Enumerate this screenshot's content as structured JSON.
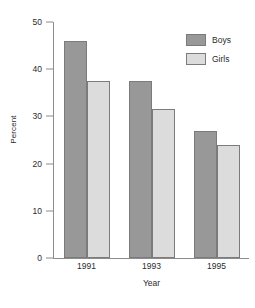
{
  "chart_data": {
    "type": "bar",
    "title": "",
    "xlabel": "Year",
    "ylabel": "Percent",
    "categories": [
      "1991",
      "1993",
      "1995"
    ],
    "series": [
      {
        "name": "Boys",
        "color": "#989898",
        "values": [
          46,
          37.5,
          27
        ]
      },
      {
        "name": "Girls",
        "color": "#dcdcdc",
        "values": [
          37.5,
          31.5,
          24
        ]
      }
    ],
    "ylim": [
      0,
      50
    ],
    "yticks": [
      0,
      10,
      20,
      30,
      40,
      50
    ],
    "ytick_labels": [
      "0",
      "10",
      "20",
      "30",
      "40",
      "50"
    ],
    "grid": false,
    "legend_position": "top-right",
    "bar_border_color": "#7b7b7b",
    "axis_color": "#8c8c8c"
  },
  "axes": {
    "y_title": "Percent",
    "x_title": "Year"
  },
  "legend": {
    "entries": [
      {
        "label": "Boys"
      },
      {
        "label": "Girls"
      }
    ]
  }
}
